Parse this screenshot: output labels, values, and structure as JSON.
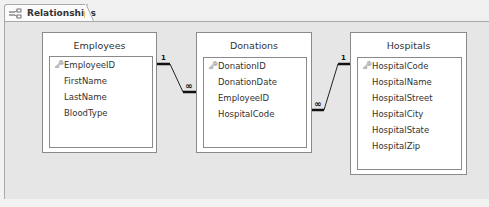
{
  "tab": {
    "label": "Relationships",
    "icon": "relationships-icon"
  },
  "tables": [
    {
      "name": "Employees",
      "fields": [
        "EmployeeID",
        "FirstName",
        "LastName",
        "BloodType"
      ],
      "key_field": "EmployeeID"
    },
    {
      "name": "Donations",
      "fields": [
        "DonationID",
        "DonationDate",
        "EmployeeID",
        "HospitalCode"
      ],
      "key_field": "DonationID"
    },
    {
      "name": "Hospitals",
      "fields": [
        "HospitalCode",
        "HospitalName",
        "HospitalStreet",
        "HospitalCity",
        "HospitalState",
        "HospitalZip"
      ],
      "key_field": "HospitalCode"
    }
  ],
  "relationships": [
    {
      "from": "Employees.EmployeeID",
      "to": "Donations.EmployeeID",
      "one_label": "1",
      "many_label": "∞"
    },
    {
      "from": "Hospitals.HospitalCode",
      "to": "Donations.HospitalCode",
      "one_label": "1",
      "many_label": "∞"
    }
  ],
  "icons": {
    "key": "🗝"
  }
}
